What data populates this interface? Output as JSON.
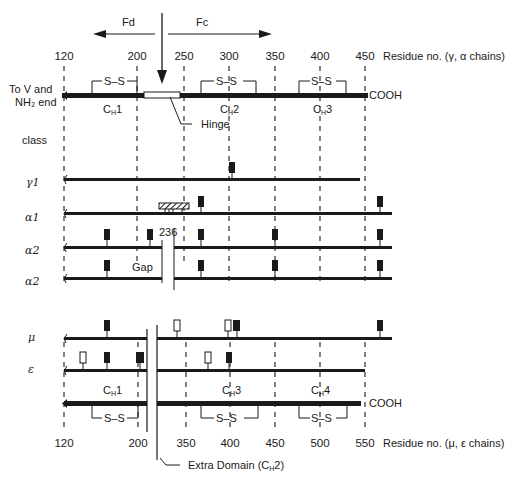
{
  "arrows": {
    "fd_label": "Fd",
    "fc_label": "Fc"
  },
  "top_axis": {
    "ticks": [
      "120",
      "200",
      "250",
      "300",
      "350",
      "400",
      "450"
    ],
    "label": "Residue no. (γ, α chains)"
  },
  "top_chain": {
    "left_label_line1": "To V and",
    "left_label_line2": "NH₂ end",
    "right_label": "COOH",
    "disulfide": "S–S",
    "domains": [
      "CH1",
      "CH2",
      "CH3"
    ],
    "domain_main": "C",
    "domain_sub": "H",
    "domain_nums": [
      "1",
      "2",
      "3"
    ],
    "hinge_label": "Hinge"
  },
  "class_label": "class",
  "classes": {
    "gamma1": "γ1",
    "alpha1": "α1",
    "alpha2a": "α2",
    "alpha2b": "α2",
    "mu": "μ",
    "epsilon": "ε"
  },
  "annotations": {
    "residue_236": "236",
    "gap": "Gap"
  },
  "bottom_chain": {
    "right_label": "COOH",
    "disulfide": "S–S",
    "domain_main": "C",
    "domain_sub": "H",
    "domain_nums": [
      "1",
      "3",
      "4"
    ],
    "extra_domain_label": "Extra Domain (C",
    "extra_domain_sub": "H",
    "extra_domain_end": "2)"
  },
  "bottom_axis": {
    "ticks": [
      "120",
      "200",
      "350",
      "400",
      "450",
      "500",
      "550"
    ],
    "label": "Residue no. (μ, ε chains)"
  },
  "colors": {
    "ink": "#1a1a1a",
    "background": "#ffffff"
  }
}
